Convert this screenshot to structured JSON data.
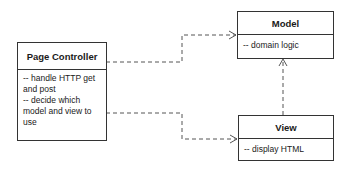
{
  "diagram": {
    "type": "UML class diagram",
    "classes": [
      {
        "id": "page-controller",
        "name": "Page Controller",
        "responsibilities": [
          "-- handle HTTP get and post",
          "-- decide which model and view to use"
        ]
      },
      {
        "id": "model",
        "name": "Model",
        "responsibilities": [
          "-- domain logic"
        ]
      },
      {
        "id": "view",
        "name": "View",
        "responsibilities": [
          "-- display HTML"
        ]
      }
    ],
    "dependencies": [
      {
        "from": "Page Controller",
        "to": "Model",
        "style": "dashed",
        "arrow": "open"
      },
      {
        "from": "Page Controller",
        "to": "View",
        "style": "dashed",
        "arrow": "open"
      },
      {
        "from": "View",
        "to": "Model",
        "style": "dashed",
        "arrow": "open"
      }
    ],
    "colors": {
      "line": "#333333",
      "background": "#ffffff",
      "text": "#1a1a1a"
    }
  }
}
